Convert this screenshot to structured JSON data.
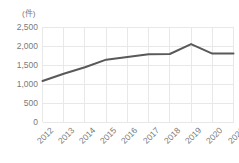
{
  "chart_data": {
    "type": "line",
    "title": "",
    "subtitle": "",
    "xlabel": "",
    "ylabel": "(件)",
    "unit_label": "(件)",
    "categories": [
      "2012",
      "2013",
      "2014",
      "2015",
      "2016",
      "2017",
      "2018",
      "2019",
      "2020",
      "2021"
    ],
    "values": [
      1080,
      1270,
      1440,
      1640,
      1710,
      1780,
      1790,
      2050,
      1800,
      1800
    ],
    "series": [
      {
        "name": "件数",
        "values": [
          1080,
          1270,
          1440,
          1640,
          1710,
          1780,
          1790,
          2050,
          1800,
          1800
        ]
      }
    ],
    "ylim": [
      0,
      2500
    ],
    "ytick_values": [
      0,
      500,
      1000,
      1500,
      2000,
      2500
    ],
    "ytick_labels": [
      "0",
      "500",
      "1,000",
      "1,500",
      "2,000",
      "2,500"
    ],
    "xtick_labels": [
      "2012",
      "2013",
      "2014",
      "2015",
      "2016",
      "2017",
      "2018",
      "2019",
      "2020",
      "2021"
    ],
    "grid": true,
    "grid_color": "#e8e8e8",
    "legend": false,
    "legend_position": "none",
    "line_color": "#595959",
    "line_width": 2,
    "markers": false,
    "text_color": "#7a7a7a",
    "background": "#ffffff",
    "xtick_rotation": -45
  }
}
